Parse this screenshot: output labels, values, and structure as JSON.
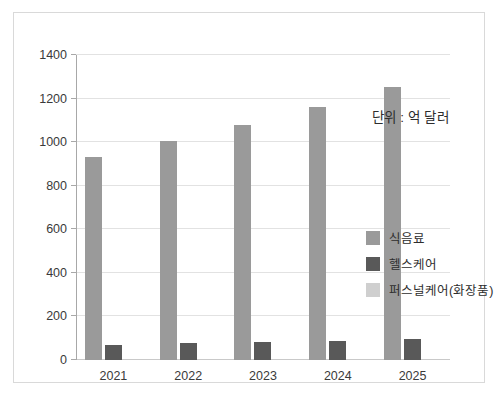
{
  "chart_data": {
    "type": "bar",
    "title": "",
    "subtitle": "",
    "xlabel": "",
    "ylabel": "",
    "categories": [
      "2021",
      "2022",
      "2023",
      "2024",
      "2025"
    ],
    "series": [
      {
        "name": "식음료",
        "color": "#9a9a9a",
        "values": [
          930,
          1005,
          1080,
          1160,
          1252
        ]
      },
      {
        "name": "헬스케어",
        "color": "#595959",
        "values": [
          70,
          76,
          82,
          88,
          95
        ]
      },
      {
        "name": "퍼스널케어(화장품)",
        "color": "#cfcfcf",
        "values": [
          0,
          0,
          0,
          0,
          0
        ]
      }
    ],
    "ylim": [
      0,
      1400
    ],
    "ytick_values": [
      0,
      200,
      400,
      600,
      800,
      1000,
      1200,
      1400
    ],
    "ytick_labels": [
      "0",
      "200",
      "400",
      "600",
      "800",
      "1000",
      "1200",
      "1400"
    ],
    "grid": true,
    "grid_axis": "y",
    "legend_position": "right-center",
    "annotations": [
      {
        "text": "단위 : 억 달러",
        "position": "upper-right"
      }
    ]
  },
  "annotation": {
    "unit_note": "단위 : 억 달러"
  },
  "colors": {
    "series_food_beverage": "#9a9a9a",
    "series_healthcare": "#595959",
    "series_personal_care": "#cfcfcf",
    "gridline": "#e2e2e2",
    "axis": "#a8a8a8",
    "frame": "#d9d9d9",
    "text": "#2d2d2d",
    "background": "#ffffff"
  }
}
